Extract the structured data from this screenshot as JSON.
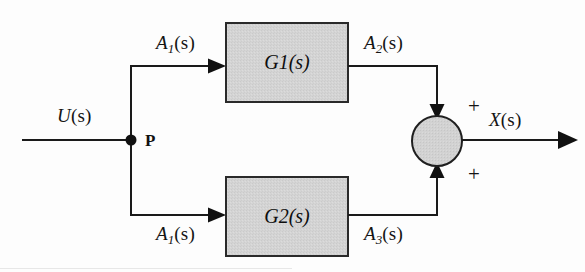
{
  "diagram": {
    "type": "control-system-block-diagram",
    "canvas": {
      "width": 585,
      "height": 272
    },
    "colors": {
      "line": "#1a1a1a",
      "block_fill": "#d3d3d3",
      "block_border": "#2a2a2a",
      "summer_fill": "#d0d0d0",
      "summer_border": "#1f1f1f",
      "background": "#fdfdfd",
      "text": "#141414"
    },
    "signals": {
      "input": {
        "name": "U",
        "arg": "(s)",
        "label": "U(s)"
      },
      "branch_upper": {
        "name": "A",
        "sub": "1",
        "arg": "(s)",
        "label": "A1(s)"
      },
      "branch_lower": {
        "name": "A",
        "sub": "1",
        "arg": "(s)",
        "label": "A1(s)"
      },
      "upper_output": {
        "name": "A",
        "sub": "2",
        "arg": "(s)",
        "label": "A2(s)"
      },
      "lower_output": {
        "name": "A",
        "sub": "3",
        "arg": "(s)",
        "label": "A3(s)"
      },
      "output": {
        "name": "X",
        "arg": "(s)",
        "label": "X(s)"
      }
    },
    "nodes": {
      "branch_point": {
        "label": "P",
        "x": 131,
        "y": 140
      }
    },
    "blocks": [
      {
        "id": "G1",
        "name": "G",
        "sub": "1",
        "arg": "(s)",
        "label": "G1(s)",
        "x": 226,
        "y": 23,
        "width": 122,
        "height": 79
      },
      {
        "id": "G2",
        "name": "G",
        "sub": "2",
        "arg": "(s)",
        "label": "G2(s)",
        "x": 226,
        "y": 177,
        "width": 122,
        "height": 79
      }
    ],
    "summing_junction": {
      "cx": 437,
      "cy": 141,
      "r": 25,
      "inputs": [
        {
          "from": "A2(s)",
          "sign": "+",
          "side": "top"
        },
        {
          "from": "A3(s)",
          "sign": "+",
          "side": "bottom"
        }
      ],
      "sign_top": "+",
      "sign_bottom": "+"
    }
  }
}
